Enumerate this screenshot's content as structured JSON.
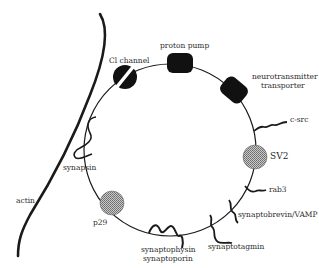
{
  "diagram": {
    "structures": {
      "vesicle": "synaptic vesicle membrane",
      "filament": "actin"
    },
    "labels": {
      "cl_channel": "Cl channel",
      "proton_pump": "proton pump",
      "nt_transporter_1": "neurotransmitter",
      "nt_transporter_2": "transporter",
      "c_src": "c-src",
      "sv2": "SV2",
      "rab3": "rab3",
      "synaptobrevin": "synaptobrevin/VAMP",
      "synaptotagmin": "synaptotagmin",
      "synaptophysin": "synaptophysin",
      "synaptoporin": "synaptoporin",
      "p29": "p29",
      "synapsin": "synapsin",
      "actin": "actin"
    },
    "colors": {
      "line": "#1a1a1a",
      "fill_dark": "#111111",
      "fill_hatched": "#9a9a9a",
      "text": "#2a2a2a"
    }
  }
}
